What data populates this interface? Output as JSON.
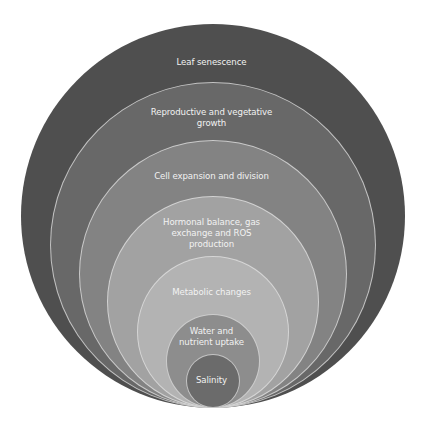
{
  "diagram": {
    "type": "nested-circles",
    "rings": [
      {
        "id": "leaf-senescence",
        "label_lines": [
          "Leaf senescence"
        ],
        "color": "#4f4f4f",
        "cx": 213,
        "cy": 216,
        "r": 192,
        "label_y": 56
      },
      {
        "id": "reproductive-vegetative-growth",
        "label_lines": [
          "Reproductive and vegetative",
          "growth"
        ],
        "color": "#686868",
        "cx": 213,
        "cy": 245,
        "r": 163,
        "label_y": 106
      },
      {
        "id": "cell-expansion-division",
        "label_lines": [
          "Cell expansion and division"
        ],
        "color": "#838383",
        "cx": 213,
        "cy": 274,
        "r": 134,
        "label_y": 171
      },
      {
        "id": "hormonal-gas-ros",
        "label_lines": [
          "Hormonal balance, gas",
          "exchange and  ROS",
          "production"
        ],
        "color": "#a2a2a2",
        "cx": 213,
        "cy": 302,
        "r": 106,
        "label_y": 218
      },
      {
        "id": "metabolic-changes",
        "label_lines": [
          "Metabolic changes"
        ],
        "color": "#b3b3b3",
        "cx": 213,
        "cy": 332,
        "r": 76,
        "label_y": 287
      },
      {
        "id": "water-nutrient-uptake",
        "label_lines": [
          "Water and",
          "nutrient uptake"
        ],
        "color": "#8d8d8d",
        "cx": 213,
        "cy": 361,
        "r": 47,
        "label_y": 326
      },
      {
        "id": "salinity",
        "label_lines": [
          "Salinity"
        ],
        "color": "#6b6b6b",
        "cx": 213,
        "cy": 381,
        "r": 27,
        "label_y": 374
      }
    ]
  },
  "labels": {
    "leaf_senescence": "Leaf senescence",
    "reproductive_line1": "Reproductive and vegetative",
    "reproductive_line2": "growth",
    "cell_expansion": "Cell expansion and division",
    "hormonal_line1": "Hormonal balance, gas",
    "hormonal_line2": "exchange and  ROS",
    "hormonal_line3": "production",
    "metabolic": "Metabolic changes",
    "water_line1": "Water and",
    "water_line2": "nutrient uptake",
    "salinity": "Salinity"
  }
}
